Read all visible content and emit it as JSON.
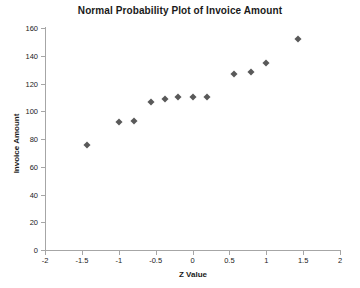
{
  "chart_data": {
    "type": "scatter",
    "title": "Normal Probability Plot of Invoice Amount",
    "xlabel": "Z Value",
    "ylabel": "Invoice Amount",
    "xlim": [
      -2,
      2
    ],
    "ylim": [
      0,
      160
    ],
    "xticks": [
      -2,
      -1.5,
      -1,
      -0.5,
      0,
      0.5,
      1,
      1.5,
      2
    ],
    "xtick_labels": [
      "-2",
      "-1.5",
      "-1",
      "-0.5",
      "0",
      "0.5",
      "1",
      "1.5",
      "2"
    ],
    "yticks": [
      0,
      20,
      40,
      60,
      80,
      100,
      120,
      140,
      160
    ],
    "ytick_labels": [
      "0",
      "20",
      "40",
      "60",
      "80",
      "100",
      "120",
      "140",
      "160"
    ],
    "grid": false,
    "legend": false,
    "marker": "diamond",
    "marker_color": "#595959",
    "x": [
      -1.43,
      -1.0,
      -0.79,
      -0.56,
      -0.37,
      -0.19,
      0.0,
      0.19,
      0.56,
      0.79,
      1.0,
      1.43
    ],
    "y": [
      76,
      92,
      93,
      107,
      109,
      110,
      110,
      110,
      127,
      128,
      135,
      152
    ],
    "points": [
      {
        "z": -1.43,
        "amount": 76
      },
      {
        "z": -1.0,
        "amount": 92
      },
      {
        "z": -0.79,
        "amount": 93
      },
      {
        "z": -0.56,
        "amount": 107
      },
      {
        "z": -0.37,
        "amount": 109
      },
      {
        "z": -0.19,
        "amount": 110
      },
      {
        "z": 0.0,
        "amount": 110
      },
      {
        "z": 0.19,
        "amount": 110
      },
      {
        "z": 0.56,
        "amount": 127
      },
      {
        "z": 0.79,
        "amount": 128
      },
      {
        "z": 1.0,
        "amount": 135
      },
      {
        "z": 1.43,
        "amount": 152
      }
    ]
  }
}
